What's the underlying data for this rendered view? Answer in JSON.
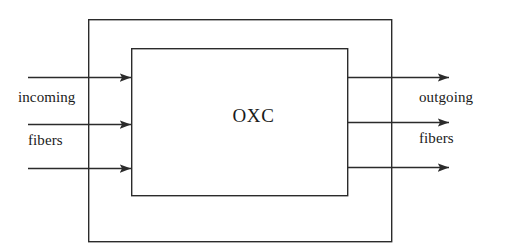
{
  "figure": {
    "type": "block-diagram",
    "title_text": "OXC",
    "background_color": "#ffffff",
    "line_color": "#2b2b2b",
    "text_color": "#1a1a1a",
    "width": 508,
    "height": 252
  },
  "boxes": {
    "outer": {
      "name": "outer-node-boundary",
      "x": 88,
      "y": 19,
      "width": 304,
      "height": 223,
      "fill": "none",
      "stroke": "#2b2b2b",
      "stroke_width": 1.4,
      "label": ""
    },
    "inner": {
      "name": "oxc-switch-box",
      "x": 131,
      "y": 48,
      "width": 217,
      "height": 148,
      "fill": "#ffffff",
      "stroke": "#2b2b2b",
      "stroke_width": 1.4,
      "label": "OXC"
    }
  },
  "labels": {
    "incoming": "incoming",
    "incoming_fibers": "fibers",
    "outgoing": "outgoing",
    "outgoing_fibers": "fibers",
    "oxc": "OXC"
  },
  "arrows": {
    "incoming": [
      {
        "name": "incoming-fiber-1",
        "x1": 28,
        "y1": 77,
        "x2": 131,
        "y2": 77
      },
      {
        "name": "incoming-fiber-2",
        "x1": 28,
        "y1": 124,
        "x2": 131,
        "y2": 124
      },
      {
        "name": "incoming-fiber-3",
        "x1": 28,
        "y1": 168,
        "x2": 131,
        "y2": 168
      }
    ],
    "outgoing": [
      {
        "name": "outgoing-fiber-1",
        "x1": 348,
        "y1": 77,
        "x2": 449,
        "y2": 77
      },
      {
        "name": "outgoing-fiber-2",
        "x1": 348,
        "y1": 122,
        "x2": 449,
        "y2": 122
      },
      {
        "name": "outgoing-fiber-3",
        "x1": 348,
        "y1": 167,
        "x2": 449,
        "y2": 167
      }
    ],
    "head_length": 11,
    "head_half_width": 4.2,
    "stroke_width": 1.5
  }
}
